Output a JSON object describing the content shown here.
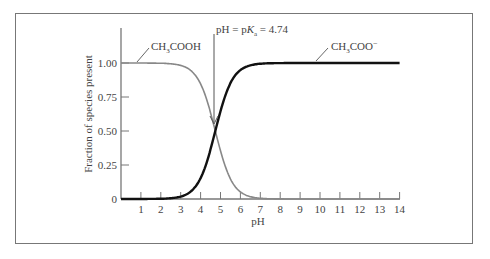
{
  "chart_data": {
    "type": "line",
    "title": "",
    "xlabel": "pH",
    "ylabel": "Fraction of species present",
    "xlim": [
      0,
      14
    ],
    "ylim": [
      0,
      1.0
    ],
    "x_ticks": [
      1,
      2,
      3,
      4,
      5,
      6,
      7,
      8,
      9,
      10,
      11,
      12,
      13,
      14
    ],
    "y_ticks": [
      "0",
      "0.25",
      "0.50",
      "0.75",
      "1.00"
    ],
    "annotation": {
      "text_prefix": "pH = p",
      "k": "K",
      "sub": "a",
      "text_suffix": " = 4.74",
      "x": 4.74
    },
    "series": [
      {
        "name": "CH3COOH",
        "label_main": "CH",
        "label_sub": "3",
        "label_rest": "COOH",
        "color": "#888888",
        "x": [
          0,
          1,
          2,
          3,
          3.5,
          4,
          4.5,
          4.74,
          5,
          5.5,
          6,
          6.5,
          7,
          8,
          14
        ],
        "values": [
          1.0,
          1.0,
          1.0,
          0.98,
          0.94,
          0.85,
          0.63,
          0.5,
          0.35,
          0.15,
          0.05,
          0.015,
          0.005,
          0.0,
          0.0
        ]
      },
      {
        "name": "CH3COO-",
        "label_main": "CH",
        "label_sub": "3",
        "label_rest": "COO",
        "label_sup": "−",
        "color": "#111111",
        "x": [
          0,
          1,
          2,
          3,
          3.5,
          4,
          4.5,
          4.74,
          5,
          5.5,
          6,
          6.5,
          7,
          8,
          14
        ],
        "values": [
          0.0,
          0.0,
          0.0,
          0.02,
          0.06,
          0.15,
          0.37,
          0.5,
          0.65,
          0.85,
          0.95,
          0.985,
          0.995,
          1.0,
          1.0
        ]
      }
    ]
  }
}
